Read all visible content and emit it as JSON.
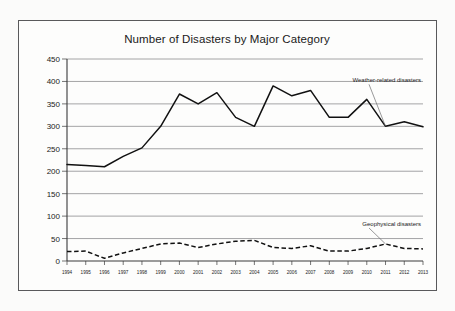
{
  "chart_data": {
    "type": "line",
    "title": "Number of Disasters by Major Category",
    "xlabel": "",
    "ylabel": "",
    "ylim": [
      0,
      450
    ],
    "ytick_step": 50,
    "yticks": [
      "0",
      "50",
      "100",
      "150",
      "200",
      "250",
      "300",
      "350",
      "400",
      "450"
    ],
    "grid": true,
    "legend_position": "inline-annotations",
    "categories": [
      "1994",
      "1995",
      "1996",
      "1997",
      "1998",
      "1999",
      "2000",
      "2001",
      "2002",
      "2003",
      "2004",
      "2005",
      "2006",
      "2007",
      "2008",
      "2009",
      "2010",
      "2011",
      "2012",
      "2013"
    ],
    "series": [
      {
        "name": "Weather-related disasters",
        "style": "solid",
        "values": [
          215,
          213,
          210,
          233,
          252,
          300,
          372,
          350,
          375,
          320,
          300,
          390,
          368,
          380,
          320,
          320,
          360,
          300,
          310,
          299
        ]
      },
      {
        "name": "Geophysical disasters",
        "style": "dashed",
        "values": [
          21,
          22,
          6,
          18,
          28,
          38,
          40,
          30,
          38,
          44,
          46,
          30,
          28,
          34,
          22,
          22,
          28,
          38,
          28,
          27
        ]
      }
    ],
    "annotations": [
      {
        "text": "Weather-related disasters",
        "target_year": "2011",
        "target_value": 300
      },
      {
        "text": "Geophysical disasters",
        "target_year": "2011",
        "target_value": 38
      }
    ]
  }
}
